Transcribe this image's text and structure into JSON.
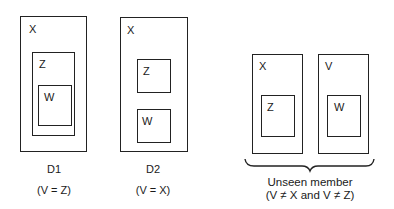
{
  "diagrams": [
    {
      "id": "D1",
      "caption": "D1",
      "condition": "(V = Z)",
      "boxes": [
        {
          "label": "X",
          "x": 20,
          "y": 16,
          "w": 67,
          "h": 136
        },
        {
          "label": "Z",
          "x": 32,
          "y": 52,
          "w": 43,
          "h": 84
        },
        {
          "label": "W",
          "x": 38,
          "y": 85,
          "w": 34,
          "h": 41
        }
      ]
    },
    {
      "id": "D2",
      "caption": "D2",
      "condition": "(V = X)",
      "boxes": [
        {
          "label": "X",
          "x": 120,
          "y": 17,
          "w": 68,
          "h": 135
        },
        {
          "label": "Z",
          "x": 137,
          "y": 59,
          "w": 34,
          "h": 34
        },
        {
          "label": "W",
          "x": 137,
          "y": 109,
          "w": 34,
          "h": 34
        }
      ]
    },
    {
      "id": "unseen",
      "caption": "Unseen member",
      "condition": "(V ≠ X and V ≠ Z)",
      "boxes": [
        {
          "label": "X",
          "x": 252,
          "y": 54,
          "w": 51,
          "h": 100
        },
        {
          "label": "Z",
          "x": 261,
          "y": 95,
          "w": 34,
          "h": 42
        },
        {
          "label": "V",
          "x": 318,
          "y": 54,
          "w": 51,
          "h": 100
        },
        {
          "label": "W",
          "x": 327,
          "y": 95,
          "w": 34,
          "h": 42
        }
      ]
    }
  ]
}
